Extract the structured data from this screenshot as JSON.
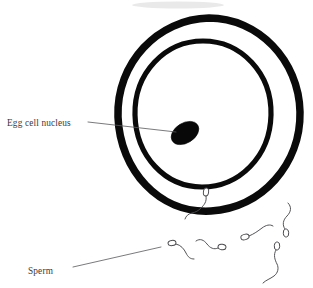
{
  "figure": {
    "background_color": "#ffffff",
    "ink_color": "#0a0a0a",
    "label_color": "#3a3a3c",
    "leader_color": "#58585c",
    "sperm_color": "#4a4a4e",
    "width": 313,
    "height": 288
  },
  "labels": {
    "egg_nucleus": "Egg cell nucleus",
    "sperm": "Sperm"
  },
  "egg": {
    "outer_membrane_name": "zona pellucida",
    "inner_membrane_name": "cell membrane",
    "outer_ring": {
      "cx": 209,
      "cy": 114,
      "rx": 91,
      "ry": 96,
      "stroke_width": 7.5
    },
    "inner_ring": {
      "cx": 203,
      "cy": 114,
      "rx": 68,
      "ry": 73,
      "stroke_width": 5.2
    },
    "nucleus": {
      "cx": 185,
      "cy": 133,
      "rx": 15,
      "ry": 10,
      "rotation_deg": -32,
      "color": "#080808"
    }
  },
  "leader_lines": {
    "egg_nucleus": {
      "x1": 88,
      "y1": 122,
      "x2": 176,
      "y2": 132
    },
    "sperm": {
      "x1": 73,
      "y1": 267,
      "x2": 161,
      "y2": 247
    }
  },
  "label_positions": {
    "egg_nucleus": {
      "x": 7,
      "y": 126
    },
    "sperm": {
      "x": 28,
      "y": 274
    }
  },
  "sperm_cells": [
    {
      "id": "penetrating-sperm",
      "head_x": 206,
      "head_y": 192,
      "note": "head inside membrane, tail outside"
    },
    {
      "id": "sperm-1",
      "head_x": 172,
      "head_y": 243
    },
    {
      "id": "sperm-2",
      "head_x": 225,
      "head_y": 248
    },
    {
      "id": "sperm-3",
      "head_x": 245,
      "head_y": 237
    },
    {
      "id": "sperm-4",
      "head_x": 285,
      "head_y": 233
    },
    {
      "id": "sperm-5",
      "head_x": 277,
      "head_y": 246
    }
  ],
  "sperm_count_visible": 6
}
